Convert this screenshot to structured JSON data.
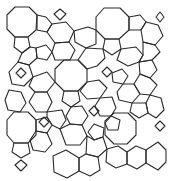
{
  "figure": {
    "stroke_color": "#2a2a2a",
    "background": "#ffffff",
    "shapes": [
      {
        "type": "octagon",
        "points": "15,7 29,7 37,15 36,30 28,37 15,37 7,29 7,15"
      },
      {
        "type": "octagon",
        "points": "104,8 120,8 129,17 129,30 119,39 105,39 96,30 96,17"
      },
      {
        "type": "octagon",
        "points": "64,60 78,60 87,69 87,82 78,91 64,91 55,82 55,69"
      },
      {
        "type": "octagon",
        "points": "14,112 28,112 36,120 36,135 28,143 14,143 7,135 7,120"
      },
      {
        "type": "octagon",
        "points": "114,113 128,113 136,121 136,135 127,144 114,144 105,135 105,121"
      },
      {
        "type": "octagon",
        "points": "53,156 66,150 79,158 79,171 67,178 54,172"
      },
      {
        "type": "octagon",
        "points": "146,150 158,142 166,150 166,162 158,170 146,163"
      },
      {
        "type": "pentagon",
        "points": "37,15 46,17 52,24 47,32 37,30"
      },
      {
        "type": "pentagon",
        "points": "129,17 140,15 146,22 141,30 129,30"
      },
      {
        "type": "pentagon",
        "points": "15,37 28,37 30,47 22,53 14,47"
      },
      {
        "type": "pentagon",
        "points": "105,39 119,39 121,49 112,55 103,49"
      },
      {
        "type": "pentagon",
        "points": "36,48 46,45 52,52 47,60 37,58"
      },
      {
        "type": "pentagon",
        "points": "112,73 122,69 128,76 123,84 113,82"
      },
      {
        "type": "pentagon",
        "points": "64,91 78,91 80,101 71,107 62,101"
      },
      {
        "type": "pentagon",
        "points": "139,62 152,60 157,70 150,78 140,74"
      },
      {
        "type": "pentagon",
        "points": "14,143 28,143 30,153 21,158 12,152"
      },
      {
        "type": "pentagon",
        "points": "36,120 47,117 52,125 47,133 36,131"
      },
      {
        "type": "pentagon",
        "points": "105,123 111,116 120,120 118,130 108,130"
      },
      {
        "type": "pentagon",
        "points": "94,124 104,128 103,137 94,140 88,132"
      },
      {
        "type": "pentagon",
        "points": "132,103 146,103 148,113 139,118 130,112"
      },
      {
        "type": "hexagon",
        "points": "52,24 66,22 74,31 69,42 55,43 47,32"
      },
      {
        "type": "hexagon",
        "points": "74,31 88,27 96,30 96,44 86,48 75,42"
      },
      {
        "type": "hexagon",
        "points": "146,22 158,25 163,36 155,45 143,42 141,30"
      },
      {
        "type": "hexagon",
        "points": "30,47 36,48 37,58 29,65 18,62 22,53"
      },
      {
        "type": "hexagon",
        "points": "52,52 55,43 69,42 75,50 70,60 55,60"
      },
      {
        "type": "hexagon",
        "points": "86,48 103,49 105,58 97,66 87,69 78,60"
      },
      {
        "type": "hexagon",
        "points": "121,49 136,47 143,55 139,62 128,66 117,60"
      },
      {
        "type": "hexagon",
        "points": "143,42 155,45 160,52 152,60 139,62 143,55"
      },
      {
        "type": "hexagon",
        "points": "18,62 29,65 33,77 24,86 12,84 9,72"
      },
      {
        "type": "hexagon",
        "points": "33,77 47,72 55,82 47,92 35,92 29,86"
      },
      {
        "type": "hexagon",
        "points": "87,82 99,80 107,88 100,98 87,99 80,91"
      },
      {
        "type": "hexagon",
        "points": "123,84 134,84 140,94 132,103 119,100 117,92"
      },
      {
        "type": "hexagon",
        "points": "140,74 150,78 157,85 150,95 140,94 134,84"
      },
      {
        "type": "hexagon",
        "points": "9,90 21,92 26,103 20,112 8,110 5,100"
      },
      {
        "type": "hexagon",
        "points": "35,92 47,92 52,102 47,112 36,112 29,102"
      },
      {
        "type": "hexagon",
        "points": "47,112 62,110 66,120 60,129 52,125 47,117"
      },
      {
        "type": "hexagon",
        "points": "71,107 82,106 88,116 82,125 70,124 66,116"
      },
      {
        "type": "hexagon",
        "points": "100,98 112,97 116,108 111,116 100,116 95,106"
      },
      {
        "type": "hexagon",
        "points": "150,95 161,98 164,110 156,118 148,113 146,103"
      },
      {
        "type": "hexagon",
        "points": "36,131 47,133 52,144 45,152 33,150 30,140"
      },
      {
        "type": "hexagon",
        "points": "60,129 70,124 82,125 87,136 80,145 66,145"
      },
      {
        "type": "hexagon",
        "points": "87,136 94,140 103,137 107,149 98,157 86,154"
      },
      {
        "type": "hexagon",
        "points": "107,149 118,146 127,152 127,164 116,168 106,162"
      },
      {
        "type": "hexagon",
        "points": "79,158 86,154 98,157 100,170 90,176 79,171"
      },
      {
        "type": "hexagon",
        "points": "127,152 136,146 146,150 146,163 137,169 127,164"
      },
      {
        "type": "square",
        "points": "60,9 66,14 60,20 54,14"
      },
      {
        "type": "square",
        "points": "160,12 164,17 160,22 156,17"
      },
      {
        "type": "square",
        "points": "21,68 26,73 21,78 16,73"
      },
      {
        "type": "square",
        "points": "107,67 112,72 107,77 102,72"
      },
      {
        "type": "square",
        "points": "94,106 99,111 94,116 89,111"
      },
      {
        "type": "square",
        "points": "44,117 49,122 44,127 39,122"
      },
      {
        "type": "square",
        "points": "160,121 165,126 160,131 155,126"
      },
      {
        "type": "square",
        "points": "21,160 27,165 21,171 15,165"
      }
    ]
  }
}
